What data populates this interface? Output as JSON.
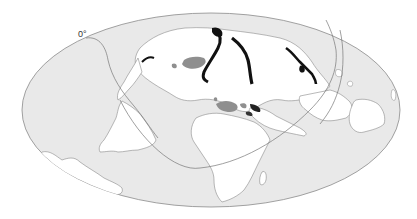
{
  "map": {
    "projection": "elliptical (Hammer/Aitoff-style) world map, rotated",
    "meridian_label": "0°",
    "colors": {
      "background": "#ffffff",
      "ocean": "#e9e9e9",
      "land": "#ffffff",
      "outline": "#7a7a7a",
      "graticule": "#777777",
      "region_dark": "#111111",
      "region_mid": "#8a8a8a"
    },
    "legend": [],
    "regions_shown": [
      "North America",
      "Greenland",
      "South America",
      "Europe",
      "Africa",
      "Asia",
      "Australia",
      "Antarctica fragment"
    ]
  }
}
